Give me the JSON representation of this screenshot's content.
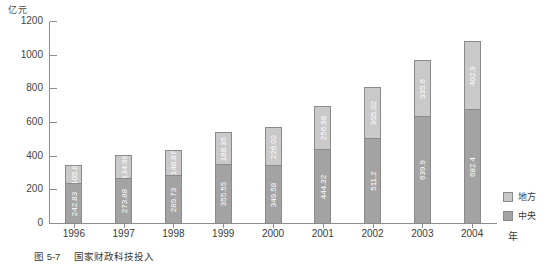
{
  "figure": {
    "unit_label": "亿元",
    "x_axis_unit": "年",
    "caption_label": "图 5-7",
    "caption_title": "国家财政科技投入"
  },
  "legend": {
    "position": "right",
    "items": [
      {
        "label": "地方",
        "color": "#c9c9c9"
      },
      {
        "label": "中央",
        "color": "#a3a3a3"
      }
    ]
  },
  "chart_data": {
    "type": "bar",
    "stacked": true,
    "title": "国家财政科技投入",
    "xlabel": "年",
    "ylabel": "亿元",
    "ylim": [
      0,
      1200
    ],
    "yticks": [
      0,
      200,
      400,
      600,
      800,
      1000,
      1200
    ],
    "ytick_labels": [
      "0",
      "200",
      "400",
      "600",
      "800",
      "1000",
      "1200"
    ],
    "grid": false,
    "categories": [
      "1996",
      "1997",
      "1998",
      "1999",
      "2000",
      "2001",
      "2002",
      "2003",
      "2004"
    ],
    "series": [
      {
        "name": "中央",
        "color": "#a3a3a3",
        "values": [
          242.83,
          273.88,
          289.73,
          355.55,
          349.58,
          444.32,
          511.2,
          639.9,
          682.4
        ]
      },
      {
        "name": "地方",
        "color": "#c9c9c9",
        "values": [
          105.8,
          134.98,
          148.87,
          188.35,
          226.02,
          256.98,
          305.02,
          335.6,
          402.9
        ]
      }
    ],
    "totals": [
      348.63,
      408.86,
      438.6,
      543.9,
      575.6,
      701.3,
      816.22,
      975.5,
      1085.3
    ]
  }
}
